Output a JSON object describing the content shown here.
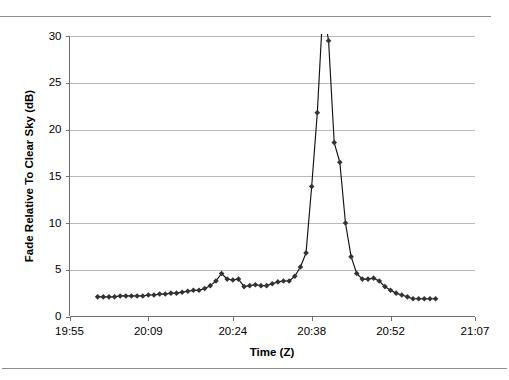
{
  "chart_data": {
    "type": "line",
    "title": "",
    "xlabel": "Time (Z)",
    "ylabel": "Fade Relative To Clear Sky (dB)",
    "grid": "horizontal",
    "legend": "none",
    "marker": "diamond",
    "line_color": "#111111",
    "marker_color": "#333333",
    "ylim": [
      0,
      30
    ],
    "yticks": [
      0,
      5,
      10,
      15,
      20,
      25,
      30
    ],
    "ytick_labels": [
      "0",
      "5",
      "10",
      "15",
      "20",
      "25",
      "30"
    ],
    "xlim_labels": [
      "19:55",
      "20:09",
      "20:24",
      "20:38",
      "20:52",
      "21:07"
    ],
    "xticks_minutes": [
      1195,
      1209,
      1224,
      1238,
      1252,
      1267
    ],
    "xtick_labels": [
      "19:55",
      "20:09",
      "20:24",
      "20:38",
      "20:52",
      "21:07"
    ],
    "note": "Peak clipped: line rises above the 30 dB axis maximum between the 21.8 dB and 29.5 dB samples",
    "x_minutes": [
      1200,
      1201,
      1202,
      1203,
      1204,
      1205,
      1206,
      1207,
      1208,
      1209,
      1210,
      1211,
      1212,
      1213,
      1214,
      1215,
      1216,
      1217,
      1218,
      1219,
      1220,
      1221,
      1222,
      1223,
      1224,
      1225,
      1226,
      1227,
      1228,
      1229,
      1230,
      1231,
      1232,
      1233,
      1234,
      1235,
      1236,
      1237,
      1238,
      1239,
      1240,
      1241,
      1242,
      1243,
      1244,
      1245,
      1246,
      1247,
      1248,
      1249,
      1250,
      1251,
      1252,
      1253,
      1254,
      1255,
      1256,
      1257,
      1258,
      1259,
      1260
    ],
    "values": [
      2.1,
      2.1,
      2.1,
      2.1,
      2.2,
      2.2,
      2.2,
      2.2,
      2.2,
      2.3,
      2.3,
      2.4,
      2.4,
      2.5,
      2.5,
      2.6,
      2.7,
      2.8,
      2.8,
      3.0,
      3.3,
      3.8,
      4.6,
      4.0,
      3.9,
      4.0,
      3.2,
      3.3,
      3.4,
      3.3,
      3.3,
      3.5,
      3.7,
      3.8,
      3.8,
      4.3,
      5.3,
      6.8,
      13.9,
      21.8,
      33.0,
      29.5,
      18.6,
      16.5,
      10.0,
      6.4,
      4.6,
      4.0,
      4.0,
      4.1,
      3.8,
      3.2,
      2.8,
      2.5,
      2.3,
      2.1,
      1.9,
      1.9,
      1.9,
      1.9,
      1.9
    ]
  }
}
